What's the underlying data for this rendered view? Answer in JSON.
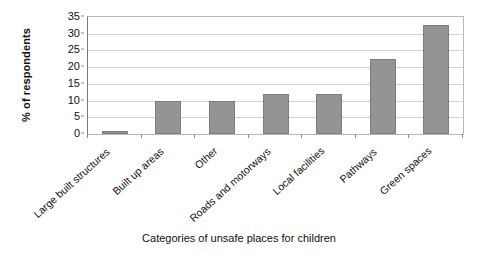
{
  "chart_data": {
    "type": "bar",
    "title": "",
    "xlabel": "Categories of unsafe places for children",
    "ylabel": "% of respondents",
    "categories": [
      "Large built structures",
      "Built up areas",
      "Other",
      "Roads and motorways",
      "Local facilities",
      "Pathways",
      "Green spaces"
    ],
    "values": [
      1,
      10,
      10,
      12,
      12,
      22.5,
      32.5
    ],
    "ylim": [
      0,
      35
    ],
    "ytick_labels": [
      "0",
      "5",
      "10",
      "15",
      "20",
      "25",
      "30",
      "35"
    ],
    "ytick_values": [
      0,
      5,
      10,
      15,
      20,
      25,
      30,
      35
    ],
    "grid": true,
    "legend": false,
    "bar_color": "#949494",
    "bar_border_color": "#7d7d7d",
    "gridline_color": "#d2d2d2",
    "axis_color": "#7a7a7a",
    "plot_border_color": "#b9b9b9",
    "background_color": "#ffffff"
  }
}
